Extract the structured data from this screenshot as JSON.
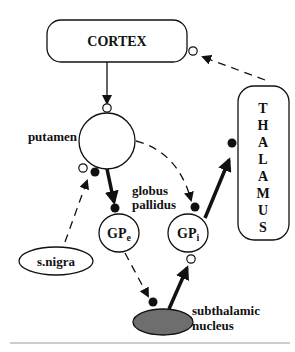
{
  "diagram": {
    "nodes": {
      "cortex": {
        "label": "CORTEX"
      },
      "thalamus": {
        "letters": [
          "T",
          "H",
          "A",
          "L",
          "A",
          "M",
          "U",
          "S"
        ]
      },
      "putamen": {
        "label": "putamen"
      },
      "globus_pallidus": {
        "label_line1": "globus",
        "label_line2": "pallidus"
      },
      "gpe": {
        "main": "GP",
        "sub": "e"
      },
      "gpi": {
        "main": "GP",
        "sub": "i"
      },
      "snigra": {
        "label": "s.nigra"
      },
      "stn": {
        "label_line1": "subthalamic",
        "label_line2": "nucleus",
        "fill": "#6e6e6e"
      }
    },
    "connections": [
      {
        "from": "cortex",
        "to": "putamen",
        "style": "solid",
        "terminal": "open-circle",
        "type": "excitatory"
      },
      {
        "from": "putamen",
        "to": "gpe",
        "style": "thick",
        "terminal": "filled-circle",
        "type": "inhibitory"
      },
      {
        "from": "putamen",
        "to": "gpi",
        "style": "dashed",
        "terminal": "filled-circle",
        "type": "inhibitory"
      },
      {
        "from": "gpi",
        "to": "thalamus",
        "style": "thick",
        "terminal": "filled-circle",
        "type": "inhibitory"
      },
      {
        "from": "thalamus",
        "to": "cortex",
        "style": "dashed",
        "terminal": "open-circle",
        "type": "excitatory"
      },
      {
        "from": "snigra",
        "to": "putamen",
        "style": "dashed",
        "terminal": "open-and-filled-circle",
        "type": "modulatory"
      },
      {
        "from": "gpe",
        "to": "stn",
        "style": "dashed",
        "terminal": "filled-circle",
        "type": "inhibitory"
      },
      {
        "from": "stn",
        "to": "gpi",
        "style": "thick",
        "terminal": "open-circle",
        "type": "excitatory"
      }
    ],
    "colors": {
      "stroke": "#111111",
      "stn_fill": "#6e6e6e",
      "separator": "#999999"
    }
  }
}
